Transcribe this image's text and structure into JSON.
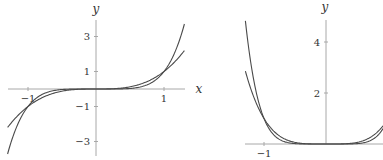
{
  "chart_data": [
    {
      "type": "line",
      "title": "",
      "xlabel": "x",
      "ylabel": "y",
      "xlim": [
        -1.3,
        1.3
      ],
      "ylim": [
        -3.8,
        3.8
      ],
      "grid": false,
      "legend": null,
      "x_ticks": [
        -1,
        1
      ],
      "x_tick_labels": [
        "−1",
        "1"
      ],
      "y_ticks": [
        3,
        1,
        -1,
        -3
      ],
      "y_tick_labels": [
        "3",
        "1",
        "−1",
        "−3"
      ],
      "series": [
        {
          "name": "y = x^3",
          "exponent": 3,
          "x": [
            -1.3,
            -1,
            -0.5,
            0,
            0.5,
            1,
            1.3
          ],
          "values": [
            -2.197,
            -1,
            -0.125,
            0,
            0.125,
            1,
            2.197
          ]
        },
        {
          "name": "y = x^5",
          "exponent": 5,
          "x": [
            -1.3,
            -1,
            -0.5,
            0,
            0.5,
            1,
            1.3
          ],
          "values": [
            -3.713,
            -1,
            -0.031,
            0,
            0.031,
            1,
            3.713
          ]
        }
      ],
      "layout": {
        "origin_px": [
          96,
          89
        ],
        "px_per_x": 68,
        "px_per_y": 17.5,
        "x_axis_px": [
          8,
          185
        ],
        "y_axis_px": [
          20,
          156
        ],
        "xlabel_px": [
          199,
          93
        ],
        "ylabel_px": [
          96,
          13
        ]
      }
    },
    {
      "type": "line",
      "title": "",
      "xlabel": "",
      "ylabel": "y",
      "xlim": [
        -1.3,
        0.92
      ],
      "ylim": [
        0,
        4.9
      ],
      "grid": false,
      "legend": null,
      "x_ticks": [
        -1
      ],
      "x_tick_labels": [
        "−1"
      ],
      "y_ticks": [
        4,
        2
      ],
      "y_tick_labels": [
        "4",
        "2"
      ],
      "series": [
        {
          "name": "y = x^4",
          "exponent": 4,
          "x": [
            -1.3,
            -1,
            -0.5,
            0,
            0.5,
            0.92
          ],
          "values": [
            2.856,
            1,
            0.0625,
            0,
            0.0625,
            0.716
          ]
        },
        {
          "name": "y = x^6",
          "exponent": 6,
          "x": [
            -1.3,
            -1,
            -0.5,
            0,
            0.5,
            0.92
          ],
          "values": [
            4.827,
            1,
            0.0156,
            0,
            0.0156,
            0.606
          ]
        }
      ],
      "layout": {
        "origin_px": [
          326,
          144
        ],
        "px_per_x": 62,
        "px_per_y": 25.5,
        "x_axis_px": [
          245,
          383
        ],
        "y_axis_px": [
          20,
          144
        ],
        "ylabel_px": [
          325,
          11
        ]
      }
    }
  ]
}
